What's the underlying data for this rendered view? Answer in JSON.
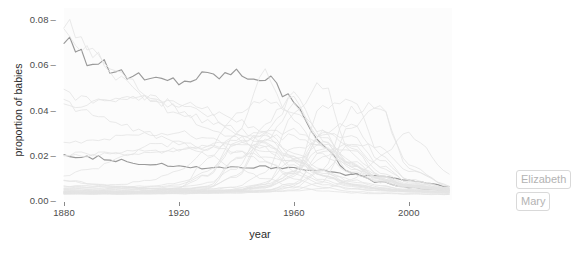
{
  "chart": {
    "title": "",
    "xlabel": "year",
    "ylabel": "proportion of babies",
    "y_ticks": [
      "0.00",
      "0.02",
      "0.04",
      "0.06",
      "0.08"
    ],
    "x_ticks": [
      "1880",
      "1920",
      "1960",
      "2000"
    ],
    "labels": {
      "elizabeth": "Elizabeth",
      "mary": "Mary"
    },
    "colors": {
      "background": "#ffffff",
      "panel": "#fcfcfc",
      "faint_line": "#e4e4e4",
      "highlight_line": "#9a9a9a",
      "axis_text": "#4d4d4d",
      "label_text": "#b3b3b3",
      "label_border": "#d9d9d9"
    }
  },
  "chart_data": {
    "type": "line",
    "title": "",
    "xlabel": "year",
    "ylabel": "proportion of babies",
    "xlim": [
      1880,
      2015
    ],
    "ylim": [
      0.0,
      0.085
    ],
    "xticks": [
      1880,
      1920,
      1960,
      2000
    ],
    "yticks": [
      0.0,
      0.02,
      0.04,
      0.06,
      0.08
    ],
    "grid": false,
    "legend": "direct-labels-right",
    "x": [
      1880,
      1890,
      1900,
      1910,
      1920,
      1930,
      1940,
      1950,
      1960,
      1970,
      1980,
      1990,
      2000,
      2015
    ],
    "series": [
      {
        "name": "Mary",
        "highlight": true,
        "values": [
          0.0724,
          0.061,
          0.056,
          0.0531,
          0.053,
          0.0553,
          0.0563,
          0.0545,
          0.044,
          0.024,
          0.0118,
          0.0078,
          0.0055,
          0.004
        ]
      },
      {
        "name": "Elizabeth",
        "highlight": true,
        "values": [
          0.02,
          0.019,
          0.0176,
          0.0158,
          0.015,
          0.0144,
          0.0147,
          0.0146,
          0.0144,
          0.0128,
          0.011,
          0.0106,
          0.0085,
          0.006
        ]
      },
      {
        "name": "Anna",
        "highlight": false,
        "values": [
          0.0802,
          0.066,
          0.0555,
          0.047,
          0.04,
          0.0345,
          0.03,
          0.0255,
          0.019,
          0.012,
          0.0072,
          0.0052,
          0.0042,
          0.0035
        ]
      },
      {
        "name": "Emma",
        "highlight": false,
        "values": [
          0.076,
          0.064,
          0.054,
          0.0452,
          0.0378,
          0.032,
          0.0272,
          0.022,
          0.0165,
          0.0105,
          0.0068,
          0.005,
          0.0041,
          0.0034
        ]
      },
      {
        "name": "Margaret",
        "highlight": false,
        "values": [
          0.047,
          0.045,
          0.0442,
          0.044,
          0.0428,
          0.0395,
          0.0345,
          0.029,
          0.0215,
          0.013,
          0.008,
          0.0058,
          0.0045,
          0.0036
        ]
      },
      {
        "name": "Helen",
        "highlight": false,
        "values": [
          0.043,
          0.043,
          0.045,
          0.0448,
          0.042,
          0.0368,
          0.031,
          0.025,
          0.0182,
          0.0112,
          0.007,
          0.0052,
          0.0042,
          0.0034
        ]
      },
      {
        "name": "Dorothy",
        "highlight": false,
        "values": [
          0.043,
          0.038,
          0.033,
          0.029,
          0.0255,
          0.023,
          0.021,
          0.0195,
          0.0175,
          0.013,
          0.009,
          0.0062,
          0.0048,
          0.0038
        ]
      },
      {
        "name": "Betty",
        "highlight": false,
        "values": [
          0.02,
          0.0205,
          0.021,
          0.0215,
          0.0222,
          0.0235,
          0.0255,
          0.0275,
          0.028,
          0.023,
          0.015,
          0.0095,
          0.0062,
          0.0044
        ]
      },
      {
        "name": "Barbara",
        "highlight": false,
        "values": [
          0.019,
          0.0198,
          0.0205,
          0.0212,
          0.0226,
          0.0245,
          0.0272,
          0.03,
          0.0305,
          0.025,
          0.016,
          0.01,
          0.0066,
          0.0046
        ]
      },
      {
        "name": "Patricia",
        "highlight": false,
        "values": [
          0.006,
          0.0062,
          0.007,
          0.009,
          0.013,
          0.022,
          0.0372,
          0.0455,
          0.04,
          0.0275,
          0.0165,
          0.0105,
          0.007,
          0.0048
        ]
      },
      {
        "name": "Linda",
        "highlight": false,
        "values": [
          0.005,
          0.005,
          0.0052,
          0.0058,
          0.007,
          0.011,
          0.029,
          0.0555,
          0.036,
          0.02,
          0.0115,
          0.0078,
          0.0055,
          0.004
        ]
      },
      {
        "name": "Susan",
        "highlight": false,
        "values": [
          0.0048,
          0.0048,
          0.005,
          0.0052,
          0.0058,
          0.0075,
          0.014,
          0.033,
          0.048,
          0.027,
          0.014,
          0.0088,
          0.0058,
          0.0042
        ]
      },
      {
        "name": "Deborah",
        "highlight": false,
        "values": [
          0.0044,
          0.0044,
          0.0045,
          0.0046,
          0.005,
          0.006,
          0.0105,
          0.03,
          0.045,
          0.0235,
          0.0125,
          0.008,
          0.0054,
          0.004
        ]
      },
      {
        "name": "Karen",
        "highlight": false,
        "values": [
          0.0042,
          0.0042,
          0.0043,
          0.0044,
          0.0048,
          0.0058,
          0.01,
          0.0275,
          0.0415,
          0.03,
          0.015,
          0.009,
          0.0058,
          0.0042
        ]
      },
      {
        "name": "Lisa",
        "highlight": false,
        "values": [
          0.004,
          0.004,
          0.004,
          0.0041,
          0.0042,
          0.0046,
          0.006,
          0.012,
          0.04,
          0.051,
          0.0205,
          0.0105,
          0.0065,
          0.0045
        ]
      },
      {
        "name": "Jennifer",
        "highlight": false,
        "values": [
          0.0038,
          0.0038,
          0.0038,
          0.0039,
          0.004,
          0.0042,
          0.0048,
          0.0062,
          0.012,
          0.042,
          0.046,
          0.02,
          0.009,
          0.0052
        ]
      },
      {
        "name": "Michelle",
        "highlight": false,
        "values": [
          0.0036,
          0.0036,
          0.0036,
          0.0037,
          0.0038,
          0.004,
          0.0044,
          0.0056,
          0.0105,
          0.03,
          0.0345,
          0.0175,
          0.0085,
          0.005
        ]
      },
      {
        "name": "Amy",
        "highlight": false,
        "values": [
          0.0035,
          0.0035,
          0.0035,
          0.0036,
          0.0037,
          0.0039,
          0.0044,
          0.006,
          0.0125,
          0.031,
          0.023,
          0.012,
          0.007,
          0.0046
        ]
      },
      {
        "name": "Melissa",
        "highlight": false,
        "values": [
          0.0034,
          0.0034,
          0.0034,
          0.0035,
          0.0036,
          0.0038,
          0.0042,
          0.0055,
          0.011,
          0.029,
          0.028,
          0.015,
          0.0078,
          0.0048
        ]
      },
      {
        "name": "Jessica",
        "highlight": false,
        "values": [
          0.0032,
          0.0032,
          0.0032,
          0.0033,
          0.0034,
          0.0036,
          0.0038,
          0.0042,
          0.0055,
          0.013,
          0.04,
          0.042,
          0.015,
          0.006
        ]
      },
      {
        "name": "Ashley",
        "highlight": false,
        "values": [
          0.003,
          0.003,
          0.003,
          0.0031,
          0.0032,
          0.0033,
          0.0035,
          0.0038,
          0.0045,
          0.008,
          0.033,
          0.04,
          0.014,
          0.0058
        ]
      },
      {
        "name": "Sarah",
        "highlight": false,
        "values": [
          0.0085,
          0.007,
          0.0058,
          0.005,
          0.0045,
          0.0042,
          0.0042,
          0.0046,
          0.007,
          0.013,
          0.025,
          0.023,
          0.013,
          0.0062
        ]
      },
      {
        "name": "Emily",
        "highlight": false,
        "values": [
          0.0088,
          0.0074,
          0.006,
          0.005,
          0.0044,
          0.004,
          0.0038,
          0.0038,
          0.004,
          0.005,
          0.009,
          0.019,
          0.029,
          0.011
        ]
      },
      {
        "name": "Ruth",
        "highlight": false,
        "values": [
          0.025,
          0.026,
          0.028,
          0.0295,
          0.03,
          0.027,
          0.0215,
          0.0165,
          0.0115,
          0.007,
          0.0048,
          0.004,
          0.0035,
          0.003
        ]
      },
      {
        "name": "Mildred",
        "highlight": false,
        "values": [
          0.011,
          0.014,
          0.019,
          0.024,
          0.025,
          0.02,
          0.014,
          0.0095,
          0.006,
          0.004,
          0.0032,
          0.0028,
          0.0026,
          0.0024
        ]
      },
      {
        "name": "Shirley",
        "highlight": false,
        "values": [
          0.003,
          0.003,
          0.0032,
          0.0036,
          0.005,
          0.018,
          0.029,
          0.018,
          0.0095,
          0.0055,
          0.0038,
          0.0032,
          0.0028,
          0.0025
        ]
      },
      {
        "name": "Nancy",
        "highlight": false,
        "values": [
          0.0055,
          0.0055,
          0.0058,
          0.0062,
          0.0075,
          0.013,
          0.025,
          0.029,
          0.018,
          0.0105,
          0.0065,
          0.0048,
          0.004,
          0.0034
        ]
      },
      {
        "name": "Donna",
        "highlight": false,
        "values": [
          0.0035,
          0.0035,
          0.0036,
          0.0038,
          0.0042,
          0.006,
          0.018,
          0.027,
          0.019,
          0.011,
          0.0068,
          0.005,
          0.004,
          0.0034
        ]
      },
      {
        "name": "Sandra",
        "highlight": false,
        "values": [
          0.0032,
          0.0032,
          0.0033,
          0.0034,
          0.0038,
          0.005,
          0.018,
          0.0245,
          0.015,
          0.009,
          0.0058,
          0.0045,
          0.0038,
          0.0032
        ]
      },
      {
        "name": "Carol",
        "highlight": false,
        "values": [
          0.0035,
          0.0036,
          0.0038,
          0.0042,
          0.0055,
          0.011,
          0.025,
          0.023,
          0.013,
          0.0078,
          0.0052,
          0.0042,
          0.0036,
          0.003
        ]
      },
      {
        "name": "Laura",
        "highlight": false,
        "values": [
          0.006,
          0.0058,
          0.0055,
          0.0052,
          0.005,
          0.005,
          0.0055,
          0.007,
          0.013,
          0.023,
          0.017,
          0.01,
          0.0062,
          0.0044
        ]
      },
      {
        "name": "Kimberly",
        "highlight": false,
        "values": [
          0.0028,
          0.0028,
          0.0028,
          0.0029,
          0.003,
          0.0032,
          0.0038,
          0.007,
          0.023,
          0.0255,
          0.0145,
          0.009,
          0.0058,
          0.0042
        ]
      },
      {
        "name": "Angela",
        "highlight": false,
        "values": [
          0.0029,
          0.0029,
          0.003,
          0.0031,
          0.0033,
          0.0036,
          0.0044,
          0.0075,
          0.018,
          0.024,
          0.016,
          0.0095,
          0.006,
          0.0043
        ]
      },
      {
        "name": "Heather",
        "highlight": false,
        "values": [
          0.0026,
          0.0026,
          0.0026,
          0.0027,
          0.0028,
          0.0029,
          0.0031,
          0.0035,
          0.006,
          0.022,
          0.023,
          0.011,
          0.0062,
          0.0044
        ]
      },
      {
        "name": "Stephanie",
        "highlight": false,
        "values": [
          0.0027,
          0.0027,
          0.0027,
          0.0028,
          0.0029,
          0.0031,
          0.0034,
          0.0042,
          0.0075,
          0.019,
          0.0245,
          0.015,
          0.008,
          0.005
        ]
      }
    ]
  }
}
